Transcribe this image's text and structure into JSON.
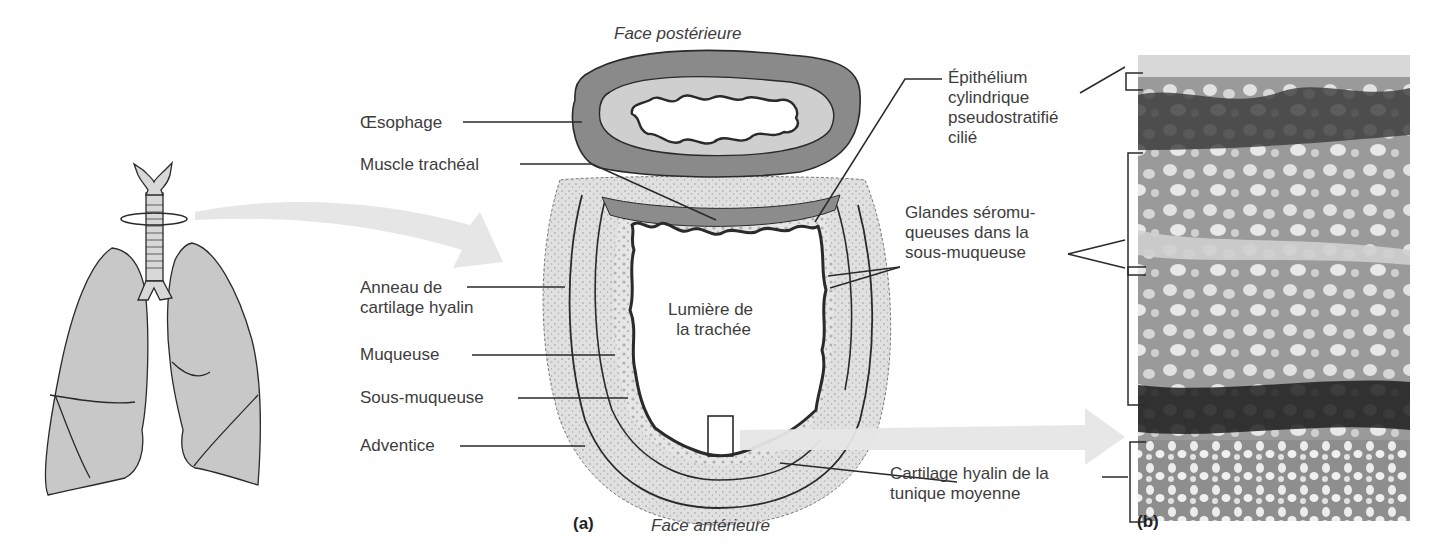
{
  "figure": {
    "panel_a_label": "(a)",
    "panel_b_label": "(b)",
    "orientation": {
      "top": "Face postérieure",
      "bottom": "Face antérieure"
    },
    "center_label_line1": "Lumière de",
    "center_label_line2": "la trachée"
  },
  "left_labels": [
    {
      "id": "oesophage",
      "lines": [
        "Œsophage"
      ]
    },
    {
      "id": "muscle-tracheal",
      "lines": [
        "Muscle trachéal"
      ]
    },
    {
      "id": "anneau-cartilage",
      "lines": [
        "Anneau de",
        "cartilage hyalin"
      ]
    },
    {
      "id": "muqueuse",
      "lines": [
        "Muqueuse"
      ]
    },
    {
      "id": "sous-muqueuse",
      "lines": [
        "Sous-muqueuse"
      ]
    },
    {
      "id": "adventice",
      "lines": [
        "Adventice"
      ]
    }
  ],
  "right_labels": [
    {
      "id": "epithelium",
      "lines": [
        "Épithélium",
        "cylindrique",
        "pseudostratifié",
        "cilié"
      ]
    },
    {
      "id": "glandes",
      "lines": [
        "Glandes séromu-",
        "queuses dans la",
        "sous-muqueuse"
      ]
    },
    {
      "id": "cartilage-tunique",
      "lines": [
        "Cartilage hyalin de la",
        "tunique moyenne"
      ]
    }
  ],
  "colors": {
    "lung_fill": "#c8c8c8",
    "oesophagus_outer": "#8a8a8a",
    "oesophagus_inner": "#cfcfcf",
    "cartilage_fill": "#dedede",
    "arrow": "#e4e4e4",
    "line": "#2a2a2a"
  }
}
